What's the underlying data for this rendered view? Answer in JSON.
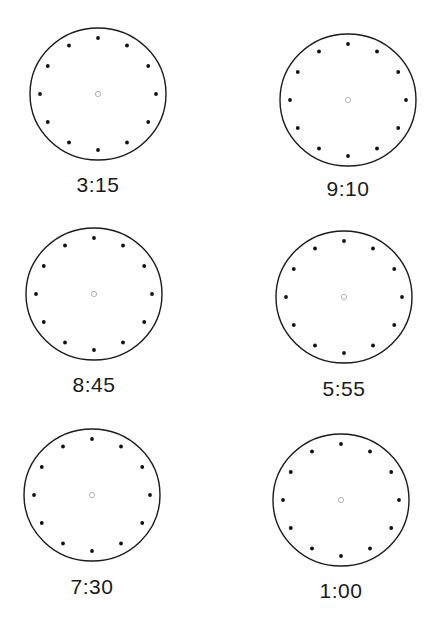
{
  "worksheet": {
    "header_fragment": "",
    "clocks": [
      {
        "id": 1,
        "time": "3:15",
        "cx": 98,
        "cy": 94,
        "rx": 68,
        "ry": 66,
        "label_y": 185
      },
      {
        "id": 2,
        "time": "9:10",
        "cx": 348,
        "cy": 100,
        "rx": 68,
        "ry": 66,
        "label_y": 189
      },
      {
        "id": 3,
        "time": "8:45",
        "cx": 94,
        "cy": 294,
        "rx": 68,
        "ry": 66,
        "label_y": 385
      },
      {
        "id": 4,
        "time": "5:55",
        "cx": 344,
        "cy": 297,
        "rx": 68,
        "ry": 66,
        "label_y": 389
      },
      {
        "id": 5,
        "time": "7:30",
        "cx": 92,
        "cy": 495,
        "rx": 68,
        "ry": 66,
        "label_y": 587
      },
      {
        "id": 6,
        "time": "1:00",
        "cx": 341,
        "cy": 500,
        "rx": 68,
        "ry": 66,
        "label_y": 591
      }
    ],
    "hour_markers_per_clock": 12,
    "colors": {
      "outline": "#1a1a1a",
      "dots": "#111111",
      "center": "#aaaaaa",
      "text": "#1a1a1a",
      "background": "#ffffff"
    }
  }
}
